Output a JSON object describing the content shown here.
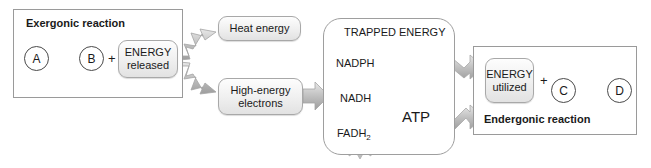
{
  "diagram": {
    "colors": {
      "stroke": "#9a9a9a",
      "dark_stroke": "#4a4a4a",
      "pill_fill": "#eeeeee",
      "arrow_gray": "#b9b9b9",
      "burst_gray": "#c9c9c9",
      "atp_fill": "#f2f2f2",
      "text": "#1a1a1a",
      "background": "#ffffff"
    },
    "exergonic": {
      "title": "Exergonic reaction",
      "reactant": "A",
      "product": "B",
      "plus": "+",
      "energy_line1": "ENERGY",
      "energy_line2": "released"
    },
    "outputs": {
      "heat": "Heat energy",
      "electrons_line1": "High-energy",
      "electrons_line2": "electrons"
    },
    "trapped": {
      "title": "TRAPPED ENERGY",
      "carriers": [
        {
          "name": "NADPH"
        },
        {
          "name": "NADH"
        },
        {
          "name": "FADH",
          "sub": "2"
        }
      ],
      "atp": "ATP"
    },
    "endergonic": {
      "title": "Endergonic reaction",
      "energy_line1": "ENERGY",
      "energy_line2": "utilized",
      "plus": "+",
      "reactant": "C",
      "product": "D"
    }
  }
}
